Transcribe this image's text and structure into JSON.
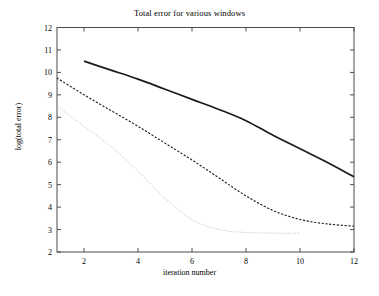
{
  "chart_data": {
    "type": "line",
    "title": "Total error for various windows",
    "xlabel": "iteration number",
    "ylabel": "log(total error)",
    "xlim": [
      1,
      12
    ],
    "ylim": [
      2,
      12
    ],
    "xticks": [
      2,
      4,
      6,
      8,
      10,
      12
    ],
    "yticks": [
      2,
      3,
      4,
      5,
      6,
      7,
      8,
      9,
      10,
      11,
      12
    ],
    "grid": false,
    "legend": null,
    "series": [
      {
        "name": "solid-curve",
        "style": "solid",
        "color": "#1a1a1a",
        "x": [
          2,
          3,
          4,
          5,
          6,
          7,
          8,
          9,
          10,
          11,
          12
        ],
        "y": [
          10.5,
          10.1,
          9.7,
          9.25,
          8.8,
          8.35,
          7.85,
          7.2,
          6.6,
          6.0,
          5.35
        ]
      },
      {
        "name": "dashed-curve",
        "style": "dashed",
        "color": "#222222",
        "x": [
          1,
          2,
          3,
          4,
          5,
          6,
          7,
          8,
          9,
          10,
          11,
          12
        ],
        "y": [
          9.75,
          9.0,
          8.3,
          7.6,
          6.85,
          6.1,
          5.3,
          4.5,
          3.85,
          3.45,
          3.25,
          3.15
        ]
      },
      {
        "name": "dotted-curve",
        "style": "dotted",
        "color": "#b3b3b3",
        "x": [
          1,
          2,
          3,
          4,
          5,
          6,
          7,
          8,
          9,
          10
        ],
        "y": [
          8.5,
          7.6,
          6.7,
          5.6,
          4.4,
          3.45,
          3.0,
          2.87,
          2.84,
          2.84
        ]
      }
    ]
  }
}
